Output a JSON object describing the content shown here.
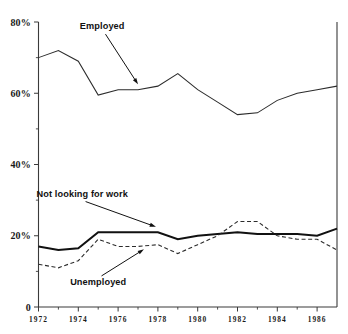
{
  "chart_data": {
    "type": "line",
    "title": "",
    "subtitle": "",
    "xlabel": "",
    "ylabel": "",
    "xlim": [
      1972,
      1987
    ],
    "ylim": [
      0,
      80
    ],
    "grid": false,
    "legend": "none (inline annotations with arrows)",
    "x": [
      1972,
      1973,
      1974,
      1975,
      1976,
      1977,
      1978,
      1979,
      1980,
      1981,
      1982,
      1983,
      1984,
      1985,
      1986,
      1987
    ],
    "y_tick_labels": [
      "0",
      "20%",
      "40%",
      "60%",
      "80%"
    ],
    "y_tick_values": [
      0,
      20,
      40,
      60,
      80
    ],
    "x_tick_labels": [
      "1972",
      "1974",
      "1976",
      "1978",
      "1980",
      "1982",
      "1984",
      "1986"
    ],
    "x_tick_values": [
      1972,
      1974,
      1976,
      1978,
      1980,
      1982,
      1984,
      1986
    ],
    "x_minor_ticks": [
      1973,
      1975,
      1977,
      1979,
      1981,
      1983,
      1985,
      1987
    ],
    "series": [
      {
        "name": "Employed",
        "style": "thin-solid",
        "values": [
          70,
          72,
          69,
          59.5,
          61,
          61,
          62,
          65.5,
          61,
          57.5,
          54,
          54.5,
          58,
          60,
          61,
          62
        ]
      },
      {
        "name": "Not looking for work",
        "style": "thick-solid",
        "values": [
          17,
          16,
          16.5,
          21,
          21,
          21,
          21,
          19,
          20,
          20.5,
          21,
          20.5,
          20.5,
          20.5,
          20,
          22
        ]
      },
      {
        "name": "Unemployed",
        "style": "dashed",
        "values": [
          12,
          11,
          13,
          19,
          17,
          17,
          17.5,
          15,
          17.5,
          20,
          24,
          24,
          20,
          19,
          19,
          16
        ]
      }
    ],
    "annotations": [
      {
        "id": "employed",
        "label": "Employed",
        "label_x": 1975.2,
        "label_y": 78,
        "target_x": 1977.0,
        "target_y": 62.5
      },
      {
        "id": "not-looking-for-work",
        "label": "Not looking for work",
        "label_x": 1974.2,
        "label_y": 31,
        "target_x": 1977.9,
        "target_y": 22.5
      },
      {
        "id": "unemployed",
        "label": "Unemployed",
        "label_x": 1975.0,
        "label_y": 6.2,
        "target_x": 1977.3,
        "target_y": 16.2
      }
    ],
    "colors": {
      "axis": "#3a3a3a",
      "employed": "#2b2b2b",
      "not_looking_for_work": "#111111",
      "unemployed": "#2b2b2b",
      "background": "#ffffff"
    }
  }
}
